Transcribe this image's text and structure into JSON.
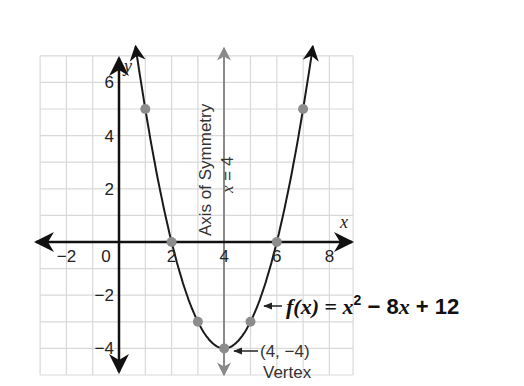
{
  "chart_data": {
    "type": "line",
    "title": "",
    "function_label": "f(x) = x² − 8x + 12",
    "function": {
      "name": "f(x)",
      "a": 1,
      "b": -8,
      "c": 12
    },
    "xlabel": "x",
    "ylabel": "y",
    "xlim": [
      -3,
      8.8
    ],
    "ylim": [
      -5,
      7
    ],
    "grid": true,
    "x_ticks": [
      -2,
      0,
      2,
      4,
      6,
      8
    ],
    "x_tick_labels": [
      "−2",
      "0",
      "2",
      "4",
      "6",
      "8"
    ],
    "y_ticks": [
      -4,
      -2,
      2,
      4,
      6
    ],
    "y_tick_labels": [
      "−4",
      "−2",
      "2",
      "4",
      "6"
    ],
    "points": [
      {
        "x": 1,
        "y": 5
      },
      {
        "x": 2,
        "y": 0
      },
      {
        "x": 3,
        "y": -3
      },
      {
        "x": 4,
        "y": -4
      },
      {
        "x": 5,
        "y": -3
      },
      {
        "x": 6,
        "y": 0
      },
      {
        "x": 7,
        "y": 5
      }
    ],
    "axis_of_symmetry": {
      "x": 4,
      "label_line1": "Axis of Symmetry",
      "label_line2": "x = 4"
    },
    "vertex": {
      "x": 4,
      "y": -4,
      "label_coord": "(4, −4)",
      "label_name": "Vertex"
    },
    "colors": {
      "curve": "#1a1a1a",
      "axes": "#111111",
      "grid": "#d9d9d9",
      "points": "#8c8c8c",
      "symmetry_line": "#8a8a8a"
    }
  },
  "labels": {
    "x_axis": "x",
    "y_axis": "y",
    "symmetry_line1": "Axis of Symmetry",
    "symmetry_line2": "x = 4",
    "vertex_coord": "(4, −4)",
    "vertex_name": "Vertex",
    "fn_f": "f(x)",
    "fn_eq": " = ",
    "fn_x": "x",
    "fn_sup": "2",
    "fn_rest1": " − 8",
    "fn_x2": "x",
    "fn_rest2": " + 12"
  }
}
